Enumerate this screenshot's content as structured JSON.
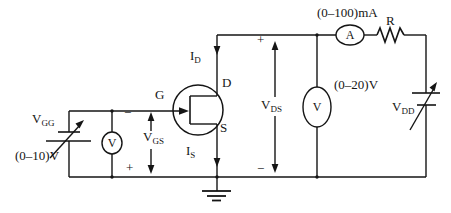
{
  "diagram": {
    "background": "#ffffff",
    "line_color": "#151515"
  },
  "labels": {
    "gate_supply": {
      "main": "V",
      "sub": "GG"
    },
    "gate_supply_range": "(0–10)V",
    "gate_voltmeter": "V",
    "vgs": {
      "main": "V",
      "sub": "GS"
    },
    "vgs_minus": "−",
    "vgs_plus": "+",
    "gate_terminal": "G",
    "drain_terminal": "D",
    "source_terminal": "S",
    "drain_current": {
      "main": "I",
      "sub": "D"
    },
    "source_current": {
      "main": "I",
      "sub": "S"
    },
    "vds": {
      "main": "V",
      "sub": "DS"
    },
    "vds_plus": "+",
    "vds_minus": "−",
    "drain_voltmeter": "V",
    "drain_voltmeter_range": "(0–20)V",
    "ammeter": "A",
    "ammeter_range": "(0–100)mA",
    "resistor": "R",
    "drain_supply": {
      "main": "V",
      "sub": "DD"
    }
  }
}
